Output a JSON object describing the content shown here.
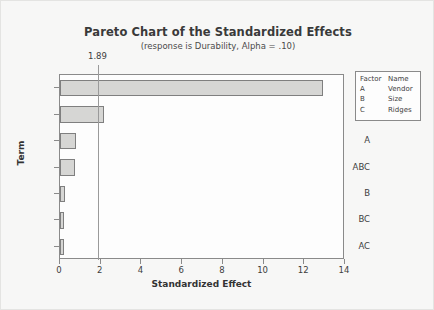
{
  "chart_data": {
    "type": "bar",
    "orientation": "horizontal",
    "title": "Pareto Chart of the Standardized Effects",
    "subtitle": "(response is Durability, Alpha = .10)",
    "xlabel": "Standardized Effect",
    "ylabel": "Term",
    "categories": [
      "AB",
      "C",
      "A",
      "ABC",
      "B",
      "BC",
      "AC"
    ],
    "values": [
      12.9,
      2.16,
      0.8,
      0.75,
      0.25,
      0.2,
      0.18
    ],
    "xlim": [
      0,
      14
    ],
    "xticks": [
      "0",
      "2",
      "4",
      "6",
      "8",
      "10",
      "12",
      "14"
    ],
    "xtick_values": [
      0,
      2,
      4,
      6,
      8,
      10,
      12,
      14
    ],
    "grid": false,
    "legend_position": "right",
    "reference_line": {
      "label": "1.89",
      "value": 1.89
    },
    "colors": {
      "bar_fill": "#d6d6d4",
      "bar_edge": "#7f7f7f",
      "frame": "#8a8a8a",
      "text": "#3d3d3d",
      "background": "#f7f7f6"
    }
  },
  "legend": {
    "headers": [
      "Factor",
      "Name"
    ],
    "rows": [
      {
        "factor": "A",
        "name": "Vendor"
      },
      {
        "factor": "B",
        "name": "Size"
      },
      {
        "factor": "C",
        "name": "Ridges"
      }
    ]
  }
}
